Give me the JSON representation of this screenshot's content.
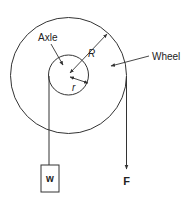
{
  "diagram": {
    "labels": {
      "axle": "Axle",
      "wheel": "Wheel",
      "big_radius": "R",
      "small_radius": "r",
      "weight": "w",
      "force": "F"
    },
    "colors": {
      "stroke": "#333333",
      "background": "#ffffff"
    }
  }
}
